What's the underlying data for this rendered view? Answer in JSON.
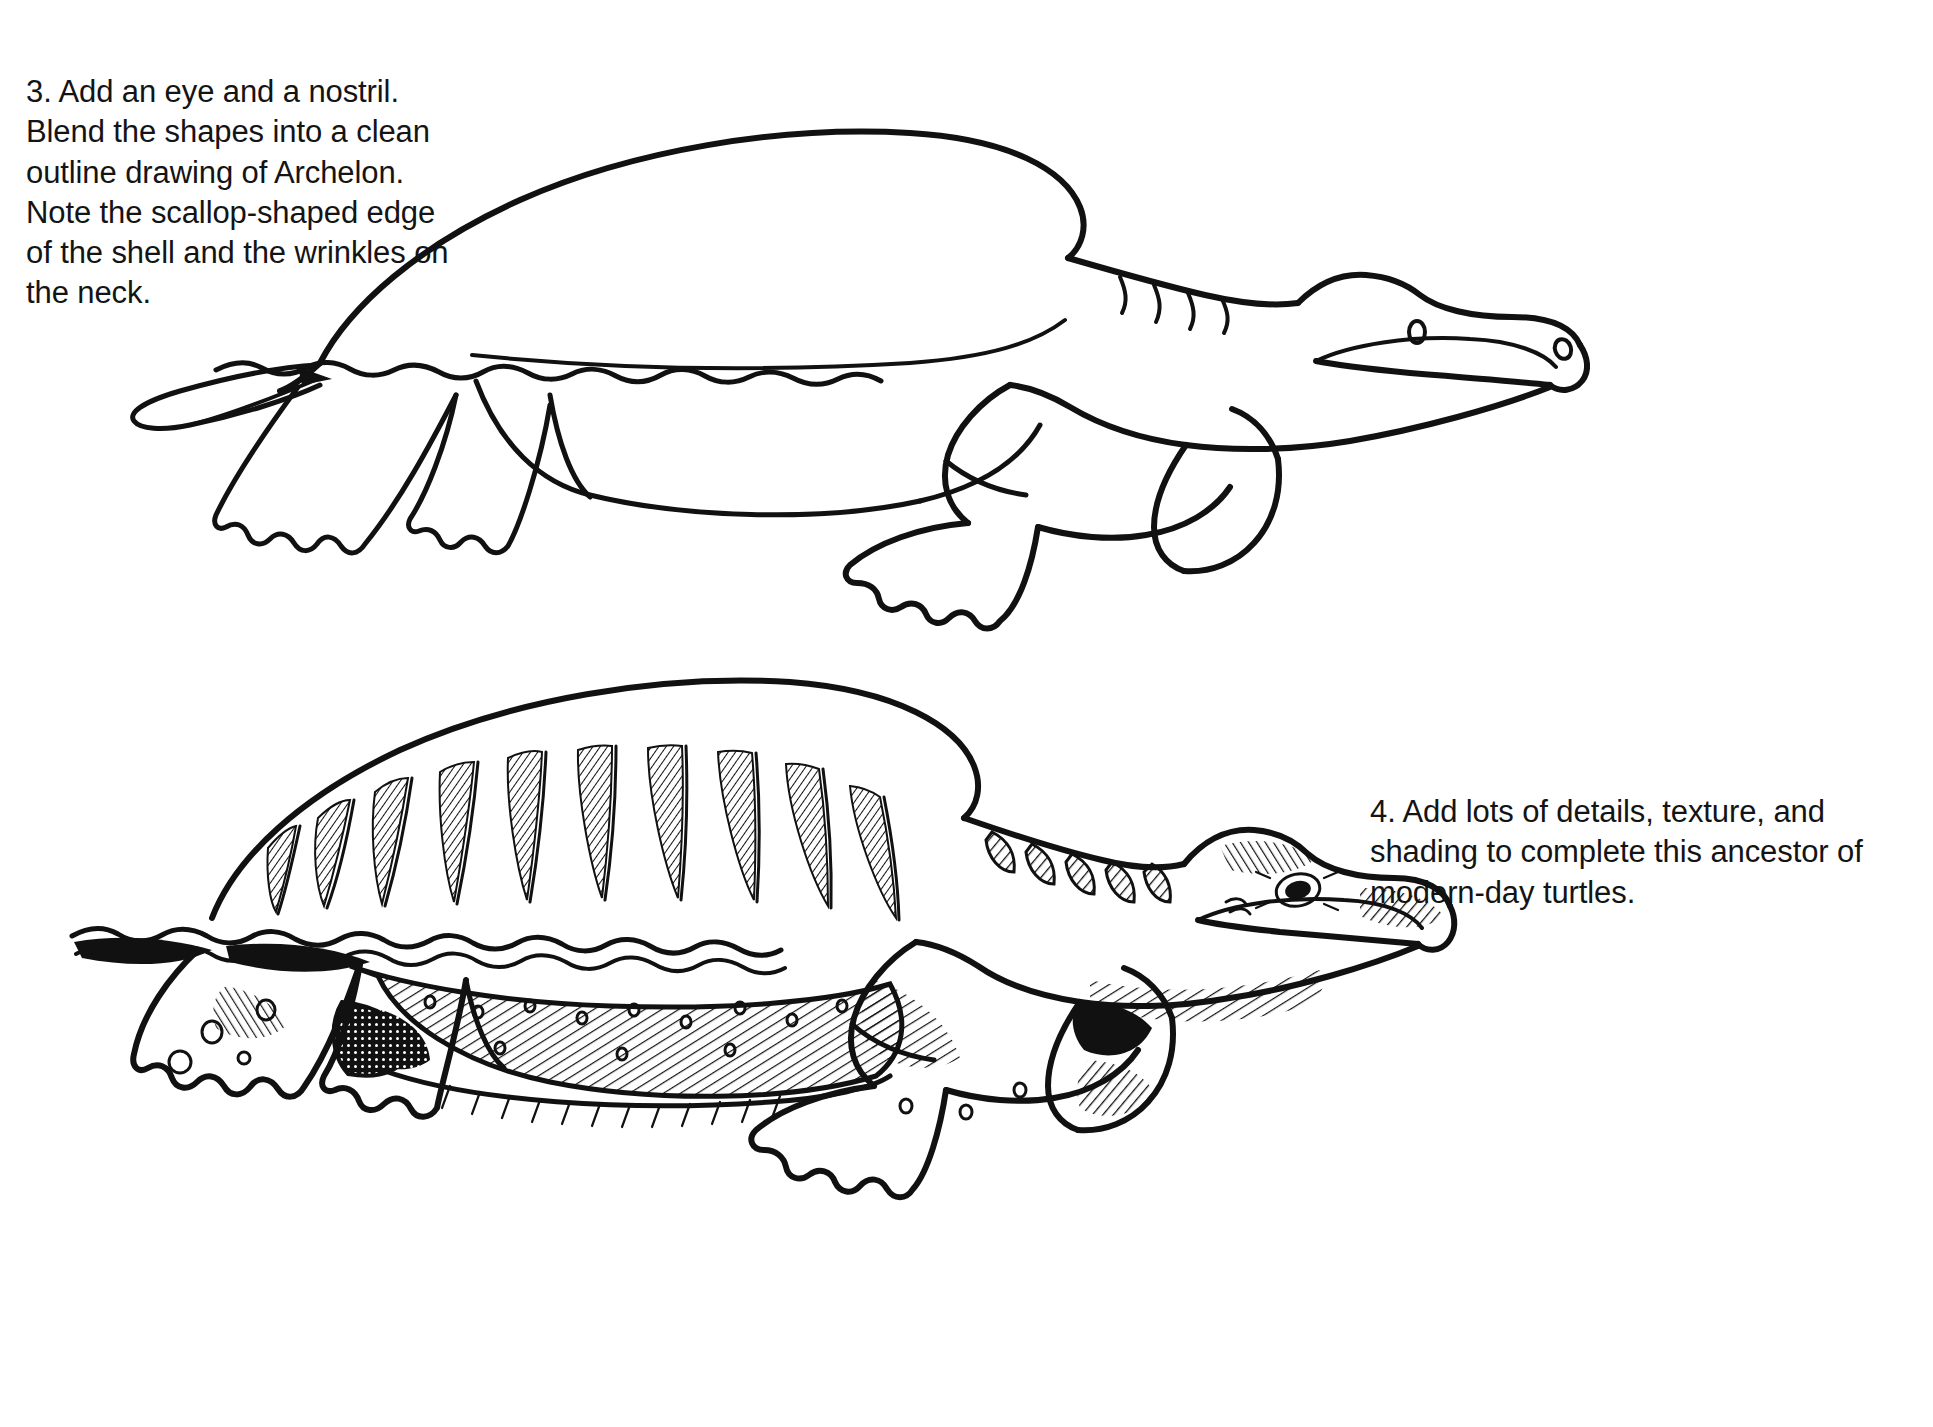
{
  "page": {
    "background_color": "#ffffff",
    "ink_color": "#111111",
    "style": "black-and-white pen-and-ink instructional line drawing"
  },
  "steps": [
    {
      "number": "3",
      "text": "3. Add an eye and a nostril. Blend the shapes into a clean outline drawing of Archelon. Note the scallop-shaped edge of the shell and the wrinkles on the neck.",
      "figure_name": "archelon-outline-drawing",
      "figure_caption": "Clean outline drawing of Archelon with eye, nostril, neck wrinkles and scalloped shell edge",
      "text_position": "top-left",
      "figure_position": "top-right",
      "figure_features": [
        "domed carapace (shell)",
        "scallop-shaped lower shell edge",
        "eye",
        "nostril",
        "wrinkles on the neck",
        "hooked beak",
        "two front flippers",
        "two rear flippers",
        "short pointed tail"
      ]
    },
    {
      "number": "4",
      "text": "4. Add lots of details, texture, and shading to complete this ancestor of modern-day turtles.",
      "figure_name": "archelon-shaded-drawing",
      "figure_caption": "Finished Archelon with hatching, texture and shading",
      "text_position": "middle-right",
      "figure_position": "bottom-left",
      "figure_features": [
        "vertical hatched ribs across the carapace",
        "scalloped double-line shell rim",
        "diagonal hatching on body and flippers",
        "small oval spots speckling skin and flippers",
        "dense cross-hatched dark shadow pockets",
        "hatched wrinkles along the neck",
        "shaded eye with radiating lines",
        "hatched hooked beak"
      ]
    }
  ],
  "icons": {
    "eye": "eye-icon",
    "nostril": "nostril-icon",
    "beak": "beak-icon",
    "tail": "tail-icon"
  }
}
